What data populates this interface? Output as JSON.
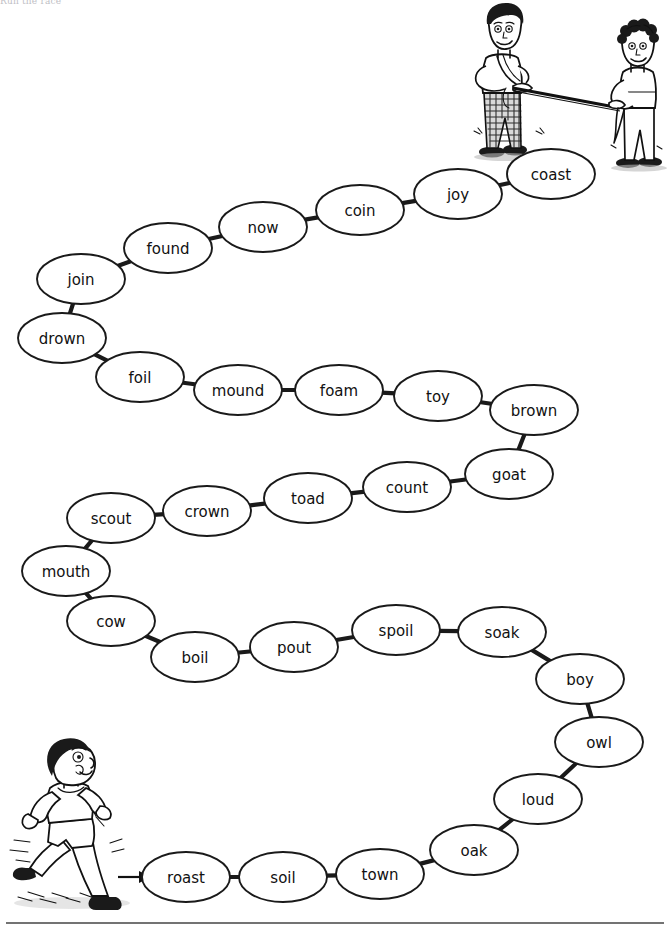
{
  "page": {
    "heading": "Run the race",
    "title": "Run the race",
    "bottom_rule": true,
    "background_color": "#ffffff",
    "ink_color": "#1a1a1a"
  },
  "illustrations": [
    {
      "name": "finish-line-tug-illustration",
      "description": "Two boys holding a finish-line rope",
      "position": "top-right"
    },
    {
      "name": "runner-illustration",
      "description": "Boy running towards the start of the track",
      "position": "bottom-left"
    },
    {
      "name": "start-arrow",
      "description": "Arrow pointing from the runner to the first word",
      "position": "bottom-left"
    }
  ],
  "track": {
    "start_word": "roast",
    "end_word": "coast",
    "count": 30,
    "nodes": [
      {
        "word": "roast",
        "x": 186,
        "y": 877
      },
      {
        "word": "soil",
        "x": 283,
        "y": 877
      },
      {
        "word": "town",
        "x": 380,
        "y": 874
      },
      {
        "word": "oak",
        "x": 474,
        "y": 850
      },
      {
        "word": "loud",
        "x": 538,
        "y": 799
      },
      {
        "word": "owl",
        "x": 599,
        "y": 742
      },
      {
        "word": "boy",
        "x": 580,
        "y": 679
      },
      {
        "word": "soak",
        "x": 502,
        "y": 632
      },
      {
        "word": "spoil",
        "x": 396,
        "y": 630
      },
      {
        "word": "pout",
        "x": 294,
        "y": 647
      },
      {
        "word": "boil",
        "x": 195,
        "y": 657
      },
      {
        "word": "cow",
        "x": 111,
        "y": 621
      },
      {
        "word": "mouth",
        "x": 66,
        "y": 571
      },
      {
        "word": "scout",
        "x": 111,
        "y": 518
      },
      {
        "word": "crown",
        "x": 207,
        "y": 511
      },
      {
        "word": "toad",
        "x": 308,
        "y": 498
      },
      {
        "word": "count",
        "x": 407,
        "y": 487
      },
      {
        "word": "goat",
        "x": 509,
        "y": 474
      },
      {
        "word": "brown",
        "x": 534,
        "y": 410
      },
      {
        "word": "toy",
        "x": 438,
        "y": 396
      },
      {
        "word": "foam",
        "x": 339,
        "y": 390
      },
      {
        "word": "mound",
        "x": 238,
        "y": 390
      },
      {
        "word": "foil",
        "x": 140,
        "y": 377
      },
      {
        "word": "drown",
        "x": 62,
        "y": 338
      },
      {
        "word": "join",
        "x": 81,
        "y": 279
      },
      {
        "word": "found",
        "x": 168,
        "y": 248
      },
      {
        "word": "now",
        "x": 263,
        "y": 227
      },
      {
        "word": "coin",
        "x": 360,
        "y": 210
      },
      {
        "word": "joy",
        "x": 458,
        "y": 194
      },
      {
        "word": "coast",
        "x": 551,
        "y": 174
      }
    ]
  }
}
